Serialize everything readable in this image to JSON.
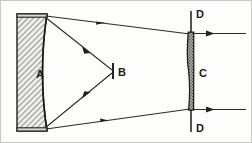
{
  "figure": {
    "kind": "optical-ray-diagram",
    "background_color": "#fdfdfb",
    "ink_color": "#2a2a2a",
    "border_color": "#c9c9c4",
    "width": 252,
    "height": 143
  },
  "labels": {
    "mirror": "A",
    "focus": "B",
    "lens": "C",
    "stop_top": "D",
    "stop_bottom": "D"
  },
  "components": {
    "concave_mirror": {
      "name": "A",
      "role": "concave reflector",
      "fill": "#e8e8e4",
      "hatch": "diagonal",
      "x_left": 17,
      "x_right": 47,
      "y_top": 14,
      "y_bottom": 131
    },
    "focal_point": {
      "name": "B",
      "role": "focus tick mark",
      "x": 113,
      "y_top": 63,
      "y_bottom": 79
    },
    "lens": {
      "name": "C",
      "role": "field lens",
      "fill": "#9a9a96",
      "texture": "stipple",
      "x": 191,
      "y_top": 32,
      "y_bottom": 110
    },
    "stop_top": {
      "name": "D",
      "role": "aperture stop line",
      "x": 191,
      "y_top": 11,
      "y_bottom": 34
    },
    "stop_bottom": {
      "name": "D",
      "role": "aperture stop line",
      "x": 191,
      "y_top": 108,
      "y_bottom": 132
    }
  },
  "rays": [
    {
      "id": "upper-incoming",
      "from": "mirror-top",
      "to": "focus",
      "arrow_at": 0.62
    },
    {
      "id": "lower-incoming",
      "from": "mirror-bottom",
      "to": "focus",
      "arrow_at": 0.62
    },
    {
      "id": "upper-outgoing",
      "from": "mirror-top",
      "to": "lens-top",
      "arrow_at": 0.6
    },
    {
      "id": "lower-outgoing",
      "from": "mirror-bottom",
      "to": "lens-bottom",
      "arrow_at": 0.62
    },
    {
      "id": "upper-exit",
      "from": "lens-top",
      "to": "right-edge",
      "arrow_at": 0.32
    },
    {
      "id": "lower-exit",
      "from": "lens-bottom",
      "to": "right-edge",
      "arrow_at": 0.32
    }
  ]
}
